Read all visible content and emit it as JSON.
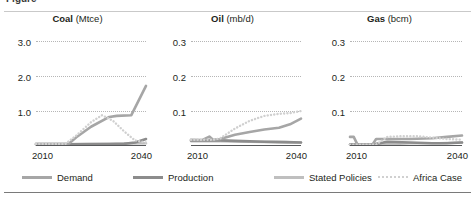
{
  "figure": {
    "caption_remnant": "Figure",
    "colors": {
      "demand": "#a6a6a6",
      "production": "#8c8c8c",
      "stated_policies": "#bfbfbf",
      "africa_case": "#d0d0d0",
      "gridline": "#b6b6b6",
      "axis": "#58595b",
      "text": "#231f20"
    }
  },
  "legend": {
    "position": "bottom",
    "items": [
      {
        "label": "Demand",
        "style": "solid",
        "color": "#a6a6a6"
      },
      {
        "label": "Production",
        "style": "solid",
        "color": "#8c8c8c"
      },
      {
        "label": "Stated Policies",
        "style": "solid",
        "color": "#bfbfbf"
      },
      {
        "label": "Africa Case",
        "style": "dotted",
        "color": "#d0d0d0"
      }
    ]
  },
  "chart_data": [
    {
      "type": "line",
      "title": "Coal",
      "unit": "(Mtce)",
      "xlabel": "",
      "ylabel": "",
      "xlim": [
        2010,
        2040
      ],
      "ylim": [
        0,
        3.4
      ],
      "xticks": [
        2010,
        2040
      ],
      "yticks": [
        1.0,
        2.0,
        3.0
      ],
      "ytick_labels": [
        "1.0",
        "2.0",
        "3.0"
      ],
      "grid": true,
      "series": [
        {
          "name": "Demand",
          "style": "solid",
          "color": "#a6a6a6",
          "x": [
            2010,
            2014,
            2018,
            2019,
            2021,
            2025,
            2030,
            2032,
            2036,
            2040
          ],
          "y": [
            0.06,
            0.06,
            0.06,
            0.07,
            0.25,
            0.55,
            0.83,
            0.86,
            0.88,
            1.72
          ]
        },
        {
          "name": "Production",
          "style": "solid",
          "color": "#8c8c8c",
          "x": [
            2010,
            2018,
            2024,
            2030,
            2034,
            2037,
            2040
          ],
          "y": [
            0.05,
            0.05,
            0.05,
            0.05,
            0.06,
            0.1,
            0.2
          ]
        },
        {
          "name": "Stated Policies",
          "style": "solid",
          "color": "#bfbfbf",
          "x": [
            2010,
            2018,
            2024,
            2030,
            2035,
            2040
          ],
          "y": [
            0.05,
            0.05,
            0.06,
            0.07,
            0.07,
            0.08
          ]
        },
        {
          "name": "Africa Case",
          "style": "dotted",
          "color": "#d0d0d0",
          "x": [
            2010,
            2018,
            2021,
            2025,
            2028,
            2031,
            2034,
            2037,
            2040
          ],
          "y": [
            0.06,
            0.06,
            0.3,
            0.68,
            0.88,
            0.72,
            0.42,
            0.16,
            0.1
          ]
        }
      ]
    },
    {
      "type": "line",
      "title": "Oil",
      "unit": "(mb/d)",
      "xlabel": "",
      "ylabel": "",
      "xlim": [
        2010,
        2040
      ],
      "ylim": [
        0,
        0.34
      ],
      "xticks": [
        2010,
        2040
      ],
      "yticks": [
        0.1,
        0.2,
        0.3
      ],
      "ytick_labels": [
        "0.1",
        "0.2",
        "0.3"
      ],
      "grid": true,
      "series": [
        {
          "name": "Demand",
          "style": "solid",
          "color": "#a6a6a6",
          "x": [
            2010,
            2013,
            2015,
            2016,
            2018,
            2022,
            2026,
            2030,
            2034,
            2037,
            2040
          ],
          "y": [
            0.018,
            0.017,
            0.027,
            0.018,
            0.02,
            0.032,
            0.04,
            0.047,
            0.052,
            0.062,
            0.078
          ]
        },
        {
          "name": "Production",
          "style": "solid",
          "color": "#8c8c8c",
          "x": [
            2010,
            2018,
            2024,
            2030,
            2036,
            2040
          ],
          "y": [
            0.016,
            0.016,
            0.014,
            0.012,
            0.011,
            0.01
          ]
        },
        {
          "name": "Stated Policies",
          "style": "solid",
          "color": "#bfbfbf",
          "x": [
            2010,
            2018,
            2026,
            2034,
            2040
          ],
          "y": [
            0.014,
            0.014,
            0.012,
            0.011,
            0.01
          ]
        },
        {
          "name": "Africa Case",
          "style": "dotted",
          "color": "#d0d0d0",
          "x": [
            2010,
            2016,
            2018,
            2022,
            2026,
            2030,
            2034,
            2037,
            2040
          ],
          "y": [
            0.018,
            0.018,
            0.022,
            0.05,
            0.072,
            0.086,
            0.092,
            0.094,
            0.1
          ]
        }
      ]
    },
    {
      "type": "line",
      "title": "Gas",
      "unit": "(bcm)",
      "xlabel": "",
      "ylabel": "",
      "xlim": [
        2010,
        2040
      ],
      "ylim": [
        0,
        0.34
      ],
      "xticks": [
        2010,
        2040
      ],
      "yticks": [
        0.1,
        0.2,
        0.3
      ],
      "ytick_labels": [
        "0.1",
        "0.2",
        "0.3"
      ],
      "grid": true,
      "series": [
        {
          "name": "Demand",
          "style": "solid",
          "color": "#a6a6a6",
          "x": [
            2010,
            2011,
            2012,
            2013,
            2016,
            2017,
            2020,
            2026,
            2032,
            2036,
            2040
          ],
          "y": [
            0.026,
            0.026,
            0.004,
            0.004,
            0.004,
            0.02,
            0.02,
            0.02,
            0.022,
            0.026,
            0.03
          ]
        },
        {
          "name": "Production",
          "style": "solid",
          "color": "#8c8c8c",
          "x": [
            2010,
            2016,
            2020,
            2026,
            2032,
            2036,
            2040
          ],
          "y": [
            0.004,
            0.004,
            0.012,
            0.01,
            0.008,
            0.008,
            0.01
          ]
        },
        {
          "name": "Stated Policies",
          "style": "solid",
          "color": "#bfbfbf",
          "x": [
            2010,
            2018,
            2026,
            2034,
            2040
          ],
          "y": [
            0.004,
            0.004,
            0.008,
            0.008,
            0.01
          ]
        },
        {
          "name": "Africa Case",
          "style": "dotted",
          "color": "#d0d0d0",
          "x": [
            2010,
            2017,
            2020,
            2024,
            2028,
            2032,
            2036,
            2040
          ],
          "y": [
            0.004,
            0.004,
            0.026,
            0.028,
            0.028,
            0.024,
            0.02,
            0.018
          ]
        }
      ]
    }
  ]
}
